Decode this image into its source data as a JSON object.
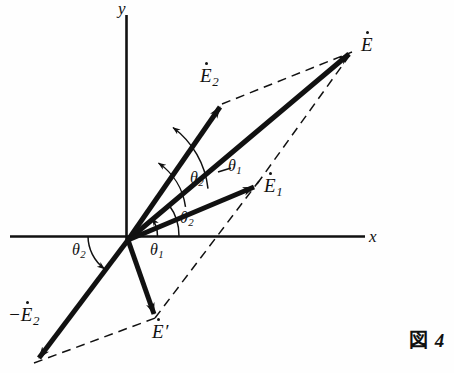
{
  "figure": {
    "caption_box": "図",
    "caption_number": "4",
    "background_color": "#fefefe",
    "ink_color": "#111111"
  },
  "axes": {
    "x_label": "x",
    "y_label": "y",
    "x_axis": {
      "x1": 10,
      "y1": 236,
      "x2": 365,
      "y2": 236
    },
    "y_axis": {
      "x1": 126,
      "y1": 15,
      "x2": 126,
      "y2": 241
    },
    "origin": {
      "x": 128,
      "y": 240
    }
  },
  "vectors": [
    {
      "name": "E-dot",
      "label_base": "E",
      "label_sub": "",
      "label_prefix": "",
      "label_suffix": "",
      "tip": {
        "x": 352,
        "y": 52
      },
      "label_pos": {
        "x": 361,
        "y": 35
      }
    },
    {
      "name": "E2-dot",
      "label_base": "E",
      "label_sub": "2",
      "label_prefix": "",
      "label_suffix": "",
      "tip": {
        "x": 222,
        "y": 104
      },
      "label_pos": {
        "x": 200,
        "y": 66
      }
    },
    {
      "name": "E1-dot",
      "label_base": "E",
      "label_sub": "1",
      "label_prefix": "",
      "label_suffix": "",
      "tip": {
        "x": 257,
        "y": 184
      },
      "label_pos": {
        "x": 264,
        "y": 176
      }
    },
    {
      "name": "E-prime-dot",
      "label_base": "E",
      "label_sub": "",
      "label_prefix": "",
      "label_suffix": "′",
      "tip": {
        "x": 155,
        "y": 318
      },
      "label_pos": {
        "x": 152,
        "y": 322
      }
    },
    {
      "name": "minus-E2-dot",
      "label_base": "E",
      "label_sub": "2",
      "label_prefix": "−",
      "label_suffix": "",
      "tip": {
        "x": 36,
        "y": 362
      },
      "label_pos": {
        "x": 10,
        "y": 305
      }
    }
  ],
  "angles": [
    {
      "name": "theta-2-between-E-and-E2",
      "symbol": "θ",
      "sub": "2",
      "pos": {
        "x": 190,
        "y": 170
      }
    },
    {
      "name": "theta-1-leader-to-E1",
      "symbol": "θ",
      "sub": "1",
      "pos": {
        "x": 222,
        "y": 160
      }
    },
    {
      "name": "theta-2-above-x-axis",
      "symbol": "θ",
      "sub": "2",
      "pos": {
        "x": 180,
        "y": 212
      }
    },
    {
      "name": "theta-1-below-x-axis",
      "symbol": "θ",
      "sub": "1",
      "pos": {
        "x": 152,
        "y": 243
      }
    },
    {
      "name": "theta-2-left-of-origin",
      "symbol": "θ",
      "sub": "2",
      "pos": {
        "x": 74,
        "y": 243
      }
    }
  ],
  "dashed_lines": [
    {
      "name": "E2-tip-to-E-tip",
      "x1": 222,
      "y1": 104,
      "x2": 352,
      "y2": 52
    },
    {
      "name": "E1-tip-to-E-tip",
      "x1": 257,
      "y1": 184,
      "x2": 352,
      "y2": 52
    },
    {
      "name": "Eprime-tip-through-E1-tip",
      "x1": 155,
      "y1": 318,
      "x2": 257,
      "y2": 184
    },
    {
      "name": "minusE2-tip-to-Eprime-tip",
      "x1": 36,
      "y1": 362,
      "x2": 155,
      "y2": 318
    }
  ]
}
